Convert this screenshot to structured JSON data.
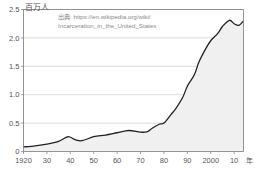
{
  "chart_data": {
    "type": "area",
    "title": "",
    "subtitle": "",
    "ylabel": "百万人",
    "xlabel": "年",
    "xlim": [
      1920,
      2014
    ],
    "ylim": [
      0,
      2.5
    ],
    "grid": true,
    "legend": null,
    "y_ticks": [
      "0",
      "0.5",
      "1.0",
      "1.5",
      "2.0",
      "2.5"
    ],
    "y_tick_values": [
      0,
      0.5,
      1.0,
      1.5,
      2.0,
      2.5
    ],
    "x_ticks": [
      "1920",
      "30",
      "40",
      "50",
      "60",
      "70",
      "80",
      "90",
      "2000",
      "10"
    ],
    "x_tick_values": [
      1920,
      1930,
      1940,
      1950,
      1960,
      1970,
      1980,
      1990,
      2000,
      2010
    ],
    "series_name": "Incarcerated population (United States)",
    "x": [
      1920,
      1925,
      1930,
      1935,
      1939,
      1942,
      1945,
      1950,
      1955,
      1960,
      1965,
      1970,
      1973,
      1975,
      1978,
      1980,
      1983,
      1985,
      1988,
      1990,
      1993,
      1995,
      1998,
      2000,
      2003,
      2005,
      2008,
      2010,
      2012,
      2014
    ],
    "values": [
      0.08,
      0.1,
      0.13,
      0.18,
      0.26,
      0.21,
      0.19,
      0.26,
      0.29,
      0.33,
      0.37,
      0.34,
      0.35,
      0.41,
      0.48,
      0.5,
      0.65,
      0.75,
      0.95,
      1.15,
      1.35,
      1.58,
      1.82,
      1.95,
      2.08,
      2.2,
      2.31,
      2.25,
      2.22,
      2.3
    ],
    "annotation": {
      "prefix": "出典:",
      "line1": "https://en.wikipedia.org/wiki/",
      "line2": "Incarceration_in_the_United_States"
    },
    "colors": {
      "line": "#222222",
      "fill": "#f0f0f0",
      "grid": "#cccccc",
      "axis": "#888888",
      "text": "#555555",
      "annotation_text": "#8a8a8a"
    }
  }
}
